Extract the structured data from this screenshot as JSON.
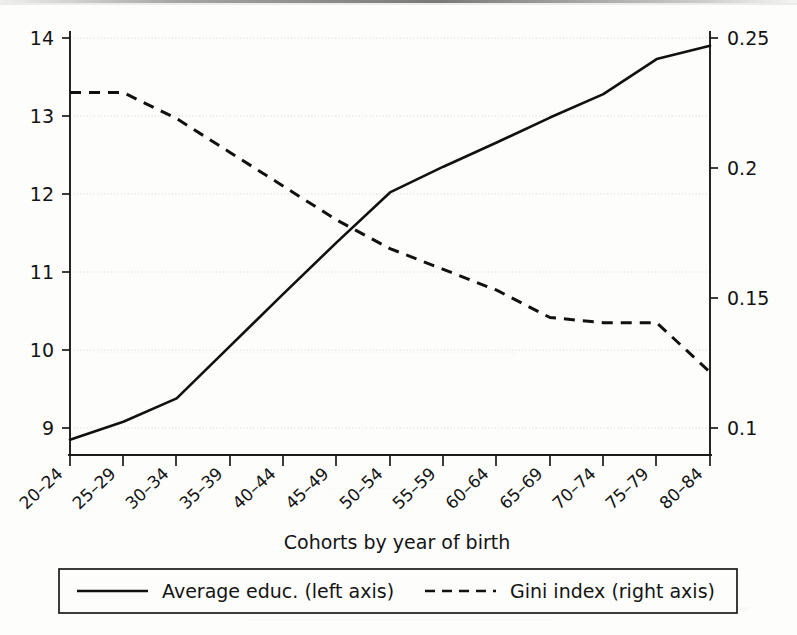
{
  "chart_data": {
    "type": "line",
    "title": "",
    "xlabel": "Cohorts by year of birth",
    "ylabel_left": "",
    "ylabel_right": "",
    "categories": [
      "20–24",
      "25–29",
      "30–34",
      "35–39",
      "40–44",
      "45–49",
      "50–54",
      "55–59",
      "60–64",
      "65–69",
      "70–74",
      "75–79",
      "80–84"
    ],
    "left_axis": {
      "ticks": [
        "9",
        "10",
        "11",
        "12",
        "13",
        "14"
      ],
      "tick_values": [
        9,
        10,
        11,
        12,
        13,
        14
      ],
      "ylim": [
        8.5,
        14.3
      ]
    },
    "right_axis": {
      "ticks": [
        "0.1",
        "0.15",
        "0.2",
        "0.25"
      ],
      "tick_values": [
        0.1,
        0.15,
        0.2,
        0.25
      ],
      "ylim": [
        0.0885,
        0.2615
      ]
    },
    "grid": true,
    "legend_position": "bottom",
    "series": [
      {
        "name": "Average educ. (left axis)",
        "axis": "left",
        "style": "solid",
        "values": [
          8.85,
          9.08,
          9.38,
          10.05,
          10.72,
          11.38,
          12.02,
          12.35,
          12.66,
          12.98,
          13.28,
          13.73,
          13.9
        ]
      },
      {
        "name": "Gini index (right axis)",
        "axis": "right",
        "style": "dashed",
        "values": [
          0.229,
          0.229,
          0.219,
          0.206,
          0.193,
          0.18,
          0.169,
          0.161,
          0.153,
          0.1425,
          0.1405,
          0.1405,
          0.1215
        ]
      }
    ]
  },
  "axes": {
    "x_title": "Cohorts by year of birth",
    "left_tick_labels": [
      "14",
      "13",
      "12",
      "11",
      "10",
      "9"
    ],
    "right_tick_labels": [
      "0.25",
      "0.2",
      "0.15",
      "0.1"
    ],
    "x_tick_labels": [
      "20–24",
      "25–29",
      "30–34",
      "35–39",
      "40–44",
      "45–49",
      "50–54",
      "55–59",
      "60–64",
      "65–69",
      "70–74",
      "75–79",
      "80–84"
    ]
  },
  "legend": {
    "items": [
      {
        "label": "Average educ. (left axis)",
        "style": "solid"
      },
      {
        "label": "Gini index (right axis)",
        "style": "dashed"
      }
    ]
  },
  "colors": {
    "ink": "#111111",
    "paper": "#fdfdfb",
    "grid": "#cfcfcf"
  }
}
